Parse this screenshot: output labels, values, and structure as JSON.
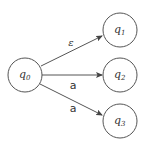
{
  "diagram": {
    "type": "nfa",
    "states": [
      {
        "id": "q0",
        "name": "q",
        "sub": "0",
        "cx": 25,
        "cy": 75,
        "r": 17
      },
      {
        "id": "q1",
        "name": "q",
        "sub": "1",
        "cx": 120,
        "cy": 30,
        "r": 17
      },
      {
        "id": "q2",
        "name": "q",
        "sub": "2",
        "cx": 120,
        "cy": 75,
        "r": 17
      },
      {
        "id": "q3",
        "name": "q",
        "sub": "3",
        "cx": 120,
        "cy": 121,
        "r": 17
      }
    ],
    "transitions": [
      {
        "from": "q0",
        "to": "q1",
        "label": "ε"
      },
      {
        "from": "q0",
        "to": "q2",
        "label": "a"
      },
      {
        "from": "q0",
        "to": "q3",
        "label": "a"
      }
    ],
    "colors": {
      "stroke": "#555555",
      "text": "#333333",
      "background": "#ffffff"
    }
  }
}
